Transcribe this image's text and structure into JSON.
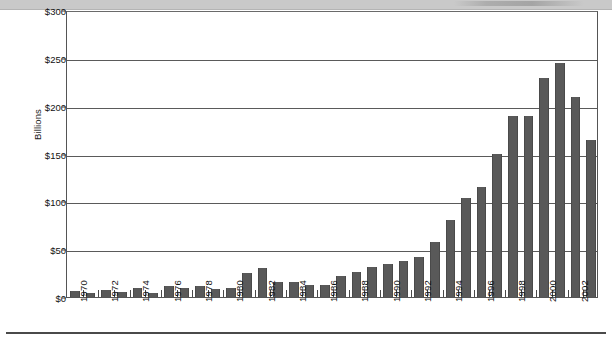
{
  "header": {
    "band_color": "#c9c9c9"
  },
  "chart_data": {
    "type": "bar",
    "title": "",
    "subtitle": "",
    "xlabel": "",
    "ylabel": "Billions",
    "ylim": [
      0,
      300
    ],
    "ytick_labels": [
      "$300",
      "$250",
      "$200",
      "$150",
      "$100",
      "$50",
      "$0"
    ],
    "ytick_values": [
      300,
      250,
      200,
      150,
      100,
      50,
      0
    ],
    "grid": true,
    "legend": "none",
    "bar_color": "#595959",
    "axis_color": "#4a4a4a",
    "categories": [
      "1970",
      "1971",
      "1972",
      "1973",
      "1974",
      "1975",
      "1976",
      "1977",
      "1978",
      "1979",
      "1980",
      "1981",
      "1982",
      "1983",
      "1984",
      "1985",
      "1986",
      "1987",
      "1988",
      "1989",
      "1990",
      "1991",
      "1992",
      "1993",
      "1994",
      "1995",
      "1996",
      "1997",
      "1998",
      "1999",
      "2000",
      "2001",
      "2002",
      "2003"
    ],
    "xtick_labels": [
      "1970",
      "1972",
      "1974",
      "1976",
      "1978",
      "1980",
      "1982",
      "1984",
      "1986",
      "1988",
      "1990",
      "1992",
      "1994",
      "1996",
      "1998",
      "2000",
      "2002"
    ],
    "values": [
      6,
      4,
      7,
      5,
      9,
      4,
      11,
      9,
      11,
      8,
      9,
      25,
      30,
      16,
      16,
      13,
      13,
      22,
      26,
      31,
      34,
      38,
      42,
      57,
      80,
      104,
      115,
      149,
      189,
      189,
      229,
      245,
      209,
      164
    ]
  }
}
